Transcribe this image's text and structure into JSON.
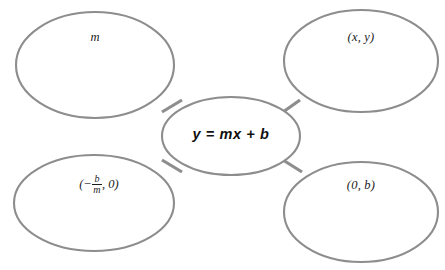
{
  "diagram": {
    "type": "concept-map",
    "title": "",
    "center": {
      "id": "center-node",
      "label": "y = mx + b",
      "shape": "ellipse"
    },
    "nodes": [
      {
        "id": "node-top-left",
        "label": "m",
        "position": "top-left",
        "shape": "ellipse"
      },
      {
        "id": "node-top-right",
        "label": "(x, y)",
        "position": "top-right",
        "shape": "ellipse"
      },
      {
        "id": "node-bottom-left",
        "label": "(-b/m, 0)",
        "label_parts": {
          "open": "(",
          "minus": "−",
          "numerator": "b",
          "denominator": "m",
          "tail": ", 0)"
        },
        "position": "bottom-left",
        "shape": "ellipse"
      },
      {
        "id": "node-bottom-right",
        "label": "(0, b)",
        "position": "bottom-right",
        "shape": "ellipse"
      }
    ],
    "connectors": [
      {
        "from": "center-node",
        "to": "node-top-left"
      },
      {
        "from": "center-node",
        "to": "node-top-right"
      },
      {
        "from": "center-node",
        "to": "node-bottom-left"
      },
      {
        "from": "center-node",
        "to": "node-bottom-right"
      }
    ],
    "colors": {
      "stroke": "#8d8d8d",
      "background": "#ffffff",
      "text": "#1b1b1b"
    }
  }
}
